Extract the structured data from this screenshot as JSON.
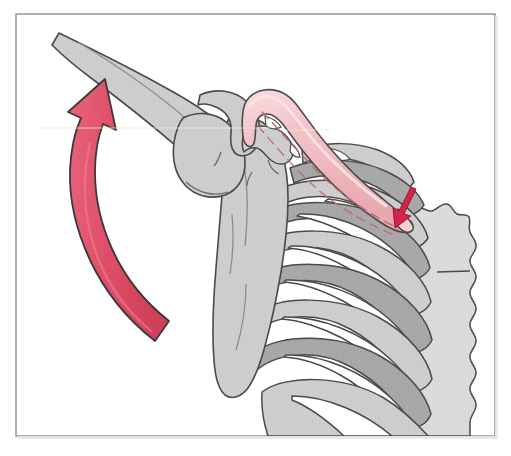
{
  "figure": {
    "title": "Shoulder girdle motion diagram",
    "caption": "Anterior view of the right shoulder girdle showing clavicle, scapula, humerus, ribs and sternum with motion arrows",
    "width": 511,
    "height": 456
  },
  "frame": {
    "border_color": "#9d9d9d",
    "background_color": "#ffffff",
    "x": 15,
    "y": 13,
    "width": 481,
    "height": 424
  },
  "palette": {
    "bone_fill": "#cfcfcf",
    "bone_fill_light": "#d8d8d8",
    "bone_shadow": "#a9a9a9",
    "cartilage_fill": "#ffffff",
    "clavicle_fill": "#f0b8bd",
    "clavicle_highlight": "#f7d7da",
    "outline": "#4a4a4a",
    "outline_soft": "#6e6e6e",
    "arrow_fill": "#e0536a",
    "arrow_fill_dark": "#cf3f58",
    "arrow_outline": "#3a3a3a",
    "small_arrow_fill": "#d4244a",
    "dash_color": "#c06a78",
    "highlight_line": "#f2efb8"
  },
  "structures": [
    {
      "id": "humerus",
      "label": "Humerus shaft",
      "fill_key": "bone_fill"
    },
    {
      "id": "humeral-head",
      "label": "Head of humerus",
      "fill_key": "bone_fill"
    },
    {
      "id": "acromion",
      "label": "Acromion process",
      "fill_key": "bone_fill"
    },
    {
      "id": "coracoid",
      "label": "Coracoid process",
      "fill_key": "bone_fill"
    },
    {
      "id": "scapula",
      "label": "Scapula",
      "fill_key": "bone_fill"
    },
    {
      "id": "clavicle",
      "label": "Clavicle",
      "fill_key": "clavicle_fill"
    },
    {
      "id": "ribcage",
      "label": "Rib cage",
      "fill_key": "bone_fill"
    },
    {
      "id": "costal-cartilage",
      "label": "Costal cartilage",
      "fill_key": "cartilage_fill"
    },
    {
      "id": "sternum",
      "label": "Sternum",
      "fill_key": "bone_fill_light"
    }
  ],
  "annotations": {
    "elevation_arrow": {
      "name": "elevation-arrow",
      "description": "Large curved arrow indicating upward elevation of the arm",
      "direction": "counterclockwise-up",
      "tail_x": 155,
      "tail_y": 342,
      "tip_x": 97,
      "tip_y": 92
    },
    "depression_arrow": {
      "name": "sternoclavicular-arrow",
      "description": "Small straight arrow at the medial clavicle indicating depression at the sternoclavicular joint",
      "direction": "down-left",
      "tail_x": 412,
      "tail_y": 190,
      "tip_x": 396,
      "tip_y": 222
    },
    "clavicle_axis": {
      "name": "clavicle-axis-dashes",
      "description": "Dashed long axis line running through the clavicle"
    }
  }
}
